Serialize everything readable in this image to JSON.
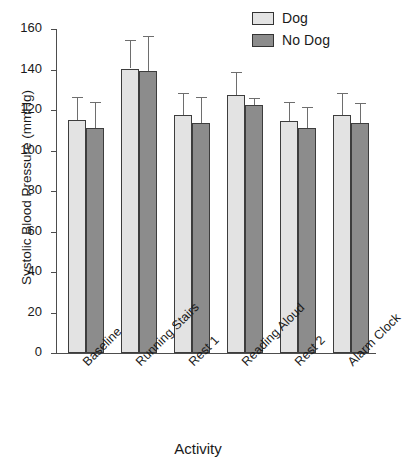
{
  "chart_data": {
    "type": "bar",
    "title": "",
    "xlabel": "Activity",
    "ylabel": "Systolic Blood Pressure (mmHg)",
    "ylim": [
      0,
      160
    ],
    "yticks": [
      0,
      20,
      40,
      60,
      80,
      100,
      120,
      140,
      160
    ],
    "ytick_labels": [
      "0",
      "20",
      "40",
      "60",
      "80",
      "100",
      "120",
      "140",
      "160"
    ],
    "grid": false,
    "legend_position": "top-right",
    "categories": [
      "Baseline",
      "Running Stairs",
      "Rest 1",
      "Reading Aloud",
      "Rest 2",
      "Alarm Clock"
    ],
    "series": [
      {
        "name": "Dog",
        "color": "#e3e3e3",
        "values": [
          115,
          140.5,
          117.5,
          127.5,
          114.5,
          117.5
        ],
        "errors": [
          11.5,
          14,
          11,
          11.5,
          9.5,
          11
        ]
      },
      {
        "name": "No Dog",
        "color": "#8c8c8c",
        "values": [
          111,
          139.5,
          113.5,
          122.5,
          111,
          113.5
        ],
        "errors": [
          13,
          17,
          13,
          3.5,
          10.5,
          10
        ]
      }
    ]
  },
  "legend": {
    "items": [
      {
        "label": "Dog",
        "color": "#e3e3e3"
      },
      {
        "label": "No Dog",
        "color": "#8c8c8c"
      }
    ]
  },
  "axes": {
    "y_title": "Systolic Blood Pressure (mmHg)",
    "x_title": "Activity"
  }
}
